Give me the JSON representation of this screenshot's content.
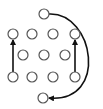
{
  "diagram": {
    "type": "node-move-diagram",
    "colors": {
      "background": "#ffffff",
      "node_stroke": "#555555",
      "arrow": "#111111"
    },
    "node_radius": 5,
    "nodes": [
      {
        "id": "top",
        "x": 44,
        "y": 14
      },
      {
        "id": "r1c1",
        "x": 13,
        "y": 34
      },
      {
        "id": "r1c2",
        "x": 32,
        "y": 34
      },
      {
        "id": "r1c3",
        "x": 53,
        "y": 34
      },
      {
        "id": "r1c4",
        "x": 75,
        "y": 34
      },
      {
        "id": "r2c1",
        "x": 23,
        "y": 55
      },
      {
        "id": "r2c2",
        "x": 44,
        "y": 55
      },
      {
        "id": "r2c3",
        "x": 65,
        "y": 55
      },
      {
        "id": "r3c1",
        "x": 13,
        "y": 77
      },
      {
        "id": "r3c2",
        "x": 32,
        "y": 77
      },
      {
        "id": "r3c3",
        "x": 53,
        "y": 77
      },
      {
        "id": "r3c4",
        "x": 75,
        "y": 77
      },
      {
        "id": "bottom",
        "x": 43,
        "y": 98
      }
    ],
    "arrows": [
      {
        "id": "left-up",
        "from": "r3c1",
        "to": "r1c1",
        "shape": "straight"
      },
      {
        "id": "right-up",
        "from": "r3c4",
        "to": "r1c4",
        "shape": "straight"
      },
      {
        "id": "top-to-bottom",
        "from": "top",
        "to": "bottom",
        "shape": "curve-right"
      }
    ]
  }
}
